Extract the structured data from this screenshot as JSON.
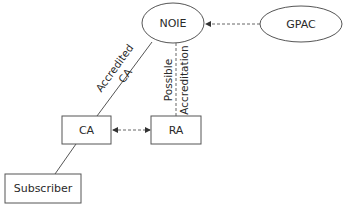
{
  "diagram": {
    "nodes": {
      "noie": {
        "label": "NOIE",
        "shape": "ellipse"
      },
      "gpac": {
        "label": "GPAC",
        "shape": "ellipse"
      },
      "ca": {
        "label": "CA",
        "shape": "rectangle"
      },
      "ra": {
        "label": "RA",
        "shape": "rectangle"
      },
      "subscriber": {
        "label": "Subscriber",
        "shape": "rectangle"
      }
    },
    "edges": {
      "gpac_noie": {
        "from": "GPAC",
        "to": "NOIE",
        "style": "dashed",
        "arrow": "to-NOIE"
      },
      "noie_ca": {
        "from": "NOIE",
        "to": "CA",
        "style": "solid",
        "label_line1": "Accredited",
        "label_line2": "CA"
      },
      "noie_ra": {
        "from": "NOIE",
        "to": "RA",
        "style": "dashed",
        "label_line1": "Possible",
        "label_line2": "Accreditation"
      },
      "ca_ra": {
        "from": "CA",
        "to": "RA",
        "style": "dashed",
        "arrow": "both"
      },
      "ca_subscriber": {
        "from": "CA",
        "to": "Subscriber",
        "style": "solid"
      }
    },
    "colors": {
      "stroke": "#555555",
      "text": "#2a2a2a",
      "background": "#ffffff"
    }
  }
}
